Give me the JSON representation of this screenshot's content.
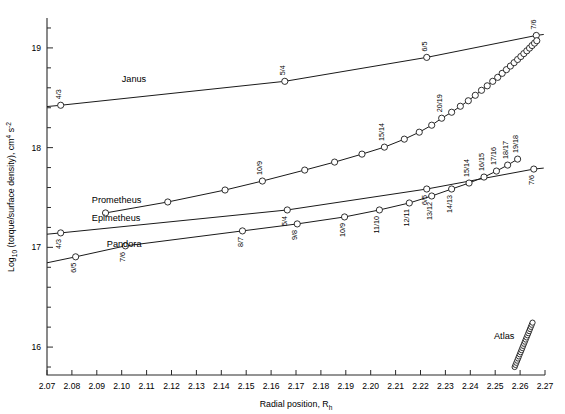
{
  "figure": {
    "type": "chart",
    "background": "#ffffff",
    "ink_color": "#1a1a1a"
  },
  "chart_data": {
    "type": "line",
    "title": "",
    "xlabel": "Radial position, R",
    "xlabel_sub": "h",
    "ylabel": "Log",
    "ylabel_sub": "10",
    "ylabel_rest": " (torque/surface density), cm",
    "ylabel_sup1": "4",
    "ylabel_rest2": " s",
    "ylabel_sup2": "-2",
    "xlim": [
      2.07,
      2.27
    ],
    "ylim": [
      15.72,
      19.3
    ],
    "xticks": [
      "2.07",
      "2.08",
      "2.09",
      "2.10",
      "2.11",
      "2.12",
      "2.13",
      "2.14",
      "2.15",
      "2.16",
      "2.17",
      "2.18",
      "2.19",
      "2.20",
      "2.21",
      "2.22",
      "2.23",
      "2.24",
      "2.25",
      "2.26",
      "2.27"
    ],
    "xtick_values": [
      2.07,
      2.08,
      2.09,
      2.1,
      2.11,
      2.12,
      2.13,
      2.14,
      2.15,
      2.16,
      2.17,
      2.18,
      2.19,
      2.2,
      2.21,
      2.22,
      2.23,
      2.24,
      2.25,
      2.26,
      2.27
    ],
    "yticks": [
      "16",
      "17",
      "18",
      "19"
    ],
    "ytick_values": [
      16,
      17,
      18,
      19
    ],
    "yminor_values": [
      15.8,
      16.2,
      16.4,
      16.6,
      16.8,
      17.2,
      17.4,
      17.6,
      17.8,
      18.2,
      18.4,
      18.6,
      18.8,
      19.2
    ],
    "grid": false,
    "legend": "inline-labels",
    "series": [
      {
        "name": "Janus",
        "label_x": 2.1,
        "label_y": 18.66,
        "points": [
          {
            "x": 2.0755,
            "y": 18.425,
            "label": "4/3",
            "marker": true
          },
          {
            "x": 2.1655,
            "y": 18.665,
            "label": "5/4",
            "marker": true
          },
          {
            "x": 2.2225,
            "y": 18.905,
            "label": "6/5",
            "marker": true
          },
          {
            "x": 2.2665,
            "y": 19.125,
            "label": "7/6",
            "marker": true
          }
        ],
        "line_start": {
          "x": 2.07,
          "y": 18.412
        },
        "line_end": {
          "x": 2.2695,
          "y": 19.135
        }
      },
      {
        "name": "Prometheus",
        "label_x": 2.088,
        "label_y": 17.44,
        "points": [
          {
            "x": 2.0935,
            "y": 17.345,
            "label": "",
            "marker": true
          },
          {
            "x": 2.1185,
            "y": 17.455,
            "label": "",
            "marker": true
          },
          {
            "x": 2.1415,
            "y": 17.575,
            "label": "",
            "marker": true
          },
          {
            "x": 2.1565,
            "y": 17.665,
            "label": "10/9",
            "marker": true
          },
          {
            "x": 2.1735,
            "y": 17.775,
            "label": "",
            "marker": true
          },
          {
            "x": 2.1855,
            "y": 17.855,
            "label": "",
            "marker": true
          },
          {
            "x": 2.1965,
            "y": 17.935,
            "label": "",
            "marker": true
          },
          {
            "x": 2.2055,
            "y": 18.005,
            "label": "15/14",
            "marker": true
          },
          {
            "x": 2.2135,
            "y": 18.085,
            "label": "",
            "marker": true
          },
          {
            "x": 2.2195,
            "y": 18.155,
            "label": "",
            "marker": true
          },
          {
            "x": 2.2245,
            "y": 18.225,
            "label": "",
            "marker": true
          },
          {
            "x": 2.2285,
            "y": 18.295,
            "label": "20/19",
            "marker": true
          },
          {
            "x": 2.2325,
            "y": 18.355,
            "label": "",
            "marker": true
          },
          {
            "x": 2.236,
            "y": 18.415,
            "label": "",
            "marker": true
          },
          {
            "x": 2.2392,
            "y": 18.47,
            "label": "",
            "marker": true
          },
          {
            "x": 2.242,
            "y": 18.525,
            "label": "",
            "marker": true
          },
          {
            "x": 2.2445,
            "y": 18.575,
            "label": "",
            "marker": true
          },
          {
            "x": 2.2468,
            "y": 18.62,
            "label": "",
            "marker": true
          },
          {
            "x": 2.249,
            "y": 18.665,
            "label": "",
            "marker": true
          },
          {
            "x": 2.251,
            "y": 18.705,
            "label": "",
            "marker": true
          },
          {
            "x": 2.2528,
            "y": 18.745,
            "label": "",
            "marker": true
          },
          {
            "x": 2.2545,
            "y": 18.782,
            "label": "",
            "marker": true
          },
          {
            "x": 2.2561,
            "y": 18.818,
            "label": "",
            "marker": true
          },
          {
            "x": 2.2576,
            "y": 18.852,
            "label": "",
            "marker": true
          },
          {
            "x": 2.259,
            "y": 18.884,
            "label": "",
            "marker": true
          },
          {
            "x": 2.2603,
            "y": 18.914,
            "label": "",
            "marker": true
          },
          {
            "x": 2.2615,
            "y": 18.943,
            "label": "",
            "marker": true
          },
          {
            "x": 2.2627,
            "y": 18.971,
            "label": "",
            "marker": true
          },
          {
            "x": 2.2638,
            "y": 18.998,
            "label": "",
            "marker": true
          },
          {
            "x": 2.2648,
            "y": 19.024,
            "label": "",
            "marker": true
          },
          {
            "x": 2.2658,
            "y": 19.048,
            "label": "",
            "marker": true
          },
          {
            "x": 2.2667,
            "y": 19.072,
            "label": "",
            "marker": true
          }
        ]
      },
      {
        "name": "Epimetheus",
        "label_x": 2.088,
        "label_y": 17.265,
        "points": [
          {
            "x": 2.0755,
            "y": 17.145,
            "label": "4/3",
            "marker": true
          },
          {
            "x": 2.1665,
            "y": 17.375,
            "label": "5/4",
            "marker": true
          },
          {
            "x": 2.2225,
            "y": 17.585,
            "label": "6/5",
            "marker": true
          },
          {
            "x": 2.2655,
            "y": 17.785,
            "label": "7/6",
            "marker": true
          }
        ],
        "line_start": {
          "x": 2.07,
          "y": 17.132
        },
        "line_end": {
          "x": 2.2695,
          "y": 17.795
        }
      },
      {
        "name": "Pandora",
        "label_x": 2.094,
        "label_y": 17.005,
        "points": [
          {
            "x": 2.0815,
            "y": 16.905,
            "label": "6/5",
            "marker": true
          },
          {
            "x": 2.1015,
            "y": 17.015,
            "label": "7/6",
            "marker": true
          },
          {
            "x": 2.1485,
            "y": 17.165,
            "label": "8/7",
            "marker": true
          },
          {
            "x": 2.1705,
            "y": 17.235,
            "label": "9/8",
            "marker": true
          },
          {
            "x": 2.1895,
            "y": 17.305,
            "label": "10/9",
            "marker": true
          },
          {
            "x": 2.2035,
            "y": 17.375,
            "label": "11/10",
            "marker": true
          },
          {
            "x": 2.2155,
            "y": 17.445,
            "label": "12/11",
            "marker": true
          },
          {
            "x": 2.2245,
            "y": 17.515,
            "label": "13/12",
            "marker": true
          },
          {
            "x": 2.2325,
            "y": 17.585,
            "label": "14/13",
            "marker": true
          },
          {
            "x": 2.2395,
            "y": 17.645,
            "label": "15/14",
            "marker": true
          },
          {
            "x": 2.2455,
            "y": 17.705,
            "label": "16/15",
            "marker": true
          },
          {
            "x": 2.2505,
            "y": 17.765,
            "label": "17/16",
            "marker": true
          },
          {
            "x": 2.255,
            "y": 17.825,
            "label": "18/17",
            "marker": true
          },
          {
            "x": 2.259,
            "y": 17.885,
            "label": "19/18",
            "marker": true
          }
        ],
        "line_start": {
          "x": 2.07,
          "y": 16.845
        }
      },
      {
        "name": "Atlas",
        "label_x": 2.2495,
        "label_y": 16.08,
        "is_dense_chain": true,
        "chain_start": {
          "x": 2.2578,
          "y": 15.8
        },
        "chain_end": {
          "x": 2.265,
          "y": 16.245
        },
        "chain_count": 22
      }
    ]
  },
  "moon_labels": [
    {
      "name": "Janus"
    },
    {
      "name": "Prometheus"
    },
    {
      "name": "Epimetheus"
    },
    {
      "name": "Pandora"
    },
    {
      "name": "Atlas"
    }
  ]
}
